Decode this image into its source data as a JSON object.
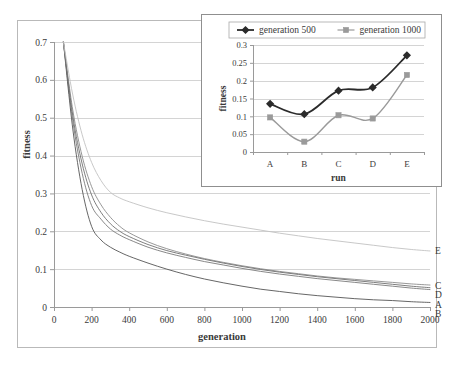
{
  "figure": {
    "background_color": "#ffffff",
    "frame_color": "#b9b9b9",
    "gridline_color": "#c9c9c9",
    "axis_color": "#9a9a9a",
    "text_color": "#3a3a3a"
  },
  "main_chart": {
    "ylabel": "fitness",
    "xlabel": "generation",
    "y_ticks": [
      "0",
      "0.1",
      "0.2",
      "0.3",
      "0.4",
      "0.5",
      "0.6",
      "0.7"
    ],
    "x_ticks": [
      "0",
      "200",
      "400",
      "600",
      "800",
      "1000",
      "1200",
      "1400",
      "1600",
      "1800",
      "2000"
    ],
    "series_labels": [
      "E",
      "C",
      "D",
      "A",
      "B"
    ]
  },
  "inset_chart": {
    "ylabel": "fitness",
    "xlabel": "run",
    "y_ticks": [
      "0",
      "0.05",
      "0.1",
      "0.15",
      "0.2",
      "0.25",
      "0.3"
    ],
    "x_ticks": [
      "A",
      "B",
      "C",
      "D",
      "E"
    ],
    "legend": [
      {
        "label": "generation 500",
        "color": "#2b2b2b",
        "marker": "diamond"
      },
      {
        "label": "generation 1000",
        "color": "#9a9a9a",
        "marker": "square"
      }
    ]
  },
  "chart_data": [
    {
      "type": "line",
      "id": "main",
      "title": "",
      "xlabel": "generation",
      "ylabel": "fitness",
      "xlim": [
        0,
        2000
      ],
      "ylim": [
        0,
        0.7
      ],
      "xticks": [
        0,
        200,
        400,
        600,
        800,
        1000,
        1200,
        1400,
        1600,
        1800,
        2000
      ],
      "yticks": [
        0,
        0.1,
        0.2,
        0.3,
        0.4,
        0.5,
        0.6,
        0.7
      ],
      "grid": true,
      "legend": "right-edge-labels",
      "x": [
        50,
        100,
        150,
        200,
        250,
        300,
        350,
        400,
        500,
        600,
        700,
        800,
        900,
        1000,
        1100,
        1200,
        1300,
        1400,
        1500,
        1600,
        1700,
        1800,
        1900,
        2000
      ],
      "series": [
        {
          "name": "A",
          "color": "#7a7a7a",
          "values": [
            0.7,
            0.492,
            0.353,
            0.268,
            0.232,
            0.206,
            0.19,
            0.178,
            0.158,
            0.143,
            0.131,
            0.12,
            0.111,
            0.102,
            0.094,
            0.087,
            0.081,
            0.075,
            0.07,
            0.065,
            0.06,
            0.055,
            0.05,
            0.046
          ]
        },
        {
          "name": "B",
          "color": "#555555",
          "values": [
            0.7,
            0.47,
            0.31,
            0.213,
            0.177,
            0.158,
            0.145,
            0.134,
            0.116,
            0.1,
            0.086,
            0.074,
            0.064,
            0.055,
            0.047,
            0.041,
            0.035,
            0.03,
            0.026,
            0.022,
            0.019,
            0.017,
            0.014,
            0.012
          ]
        },
        {
          "name": "C",
          "color": "#8c8c8c",
          "values": [
            0.7,
            0.52,
            0.398,
            0.318,
            0.27,
            0.237,
            0.213,
            0.196,
            0.172,
            0.154,
            0.14,
            0.128,
            0.118,
            0.109,
            0.101,
            0.094,
            0.088,
            0.082,
            0.077,
            0.073,
            0.069,
            0.065,
            0.061,
            0.058
          ]
        },
        {
          "name": "D",
          "color": "#6f6f6f",
          "values": [
            0.7,
            0.505,
            0.378,
            0.296,
            0.25,
            0.22,
            0.2,
            0.186,
            0.165,
            0.149,
            0.137,
            0.126,
            0.116,
            0.107,
            0.099,
            0.092,
            0.086,
            0.08,
            0.075,
            0.07,
            0.065,
            0.06,
            0.055,
            0.051
          ]
        },
        {
          "name": "E",
          "color": "#c2c2c2",
          "values": [
            0.7,
            0.56,
            0.455,
            0.382,
            0.334,
            0.303,
            0.288,
            0.278,
            0.262,
            0.249,
            0.238,
            0.228,
            0.219,
            0.211,
            0.203,
            0.195,
            0.188,
            0.181,
            0.175,
            0.169,
            0.163,
            0.157,
            0.152,
            0.148
          ]
        }
      ]
    },
    {
      "type": "line",
      "id": "inset",
      "title": "",
      "xlabel": "run",
      "ylabel": "fitness",
      "categories": [
        "A",
        "B",
        "C",
        "D",
        "E"
      ],
      "ylim": [
        0,
        0.3
      ],
      "yticks": [
        0,
        0.05,
        0.1,
        0.15,
        0.2,
        0.25,
        0.3
      ],
      "grid": true,
      "legend": "top",
      "series": [
        {
          "name": "generation 500",
          "color": "#2b2b2b",
          "marker": "diamond",
          "values": [
            0.135,
            0.106,
            0.172,
            0.181,
            0.271
          ]
        },
        {
          "name": "generation 1000",
          "color": "#9a9a9a",
          "marker": "square",
          "values": [
            0.097,
            0.029,
            0.103,
            0.094,
            0.216
          ]
        }
      ]
    }
  ]
}
